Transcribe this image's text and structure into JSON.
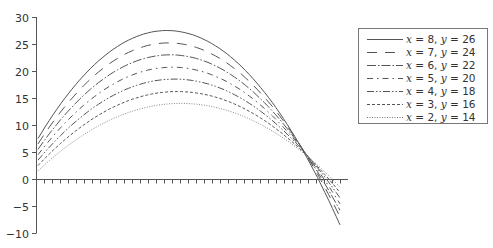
{
  "chart_data": {
    "type": "line",
    "title": "",
    "xlabel": "",
    "ylabel": "",
    "ylim": [
      -10,
      30
    ],
    "yticks": [
      -10,
      -5,
      0,
      5,
      10,
      15,
      20,
      25,
      30
    ],
    "ytick_labels": [
      "−10",
      "−5",
      "0",
      "5",
      "10",
      "15",
      "20",
      "25",
      "30"
    ],
    "x_ticks_count": 39,
    "x_tick_labels": [],
    "grid": false,
    "legend_position": "right",
    "series": [
      {
        "name": "x = 8, y = 26",
        "style": "solid",
        "start": 7.5,
        "peak": 27.5,
        "end": -8.5
      },
      {
        "name": "x = 7, y = 24",
        "style": "long-dash",
        "start": 6.5,
        "peak": 25.2,
        "end": -7.0
      },
      {
        "name": "x = 6, y = 22",
        "style": "dash-dot",
        "start": 5.5,
        "peak": 23.0,
        "end": -5.8
      },
      {
        "name": "x = 5, y = 20",
        "style": "dash-dot-gap",
        "start": 4.5,
        "peak": 20.7,
        "end": -4.6
      },
      {
        "name": "x = 4, y = 18",
        "style": "dash-dot-dot",
        "start": 3.5,
        "peak": 18.5,
        "end": -3.5
      },
      {
        "name": "x = 3, y = 16",
        "style": "short-dash",
        "start": 2.5,
        "peak": 16.2,
        "end": -2.5
      },
      {
        "name": "x = 2, y = 14",
        "style": "dotted",
        "start": 1.5,
        "peak": 14.0,
        "end": -1.5
      }
    ],
    "annotation": "All curves intersect near a common point at y ≈ 5 before crossing zero"
  },
  "legend": {
    "items": [
      {
        "xlabel": "x",
        "xval": " = 8, ",
        "ylabel": "y",
        "yval": " = 26"
      },
      {
        "xlabel": "x",
        "xval": " = 7, ",
        "ylabel": "y",
        "yval": " = 24"
      },
      {
        "xlabel": "x",
        "xval": " = 6, ",
        "ylabel": "y",
        "yval": " = 22"
      },
      {
        "xlabel": "x",
        "xval": " = 5, ",
        "ylabel": "y",
        "yval": " = 20"
      },
      {
        "xlabel": "x",
        "xval": " = 4, ",
        "ylabel": "y",
        "yval": " = 18"
      },
      {
        "xlabel": "x",
        "xval": " = 3, ",
        "ylabel": "y",
        "yval": " = 16"
      },
      {
        "xlabel": "x",
        "xval": " = 2, ",
        "ylabel": "y",
        "yval": " = 14"
      }
    ]
  }
}
